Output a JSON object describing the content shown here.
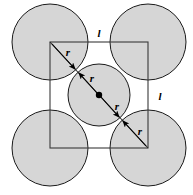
{
  "figure": {
    "background_color": "#ffffff",
    "circle_fill_color": "#d6d6d6",
    "stroke_color": "#1a1a1a",
    "square": {
      "x": 50,
      "y": 42,
      "side": 98,
      "side_label_top": "l",
      "side_label_right": "l"
    },
    "corner_circles": {
      "radius": 38,
      "centers": [
        {
          "cx": 50,
          "cy": 42,
          "name": "top-left"
        },
        {
          "cx": 148,
          "cy": 42,
          "name": "top-right"
        },
        {
          "cx": 50,
          "cy": 148,
          "name": "bottom-left"
        },
        {
          "cx": 148,
          "cy": 148,
          "name": "bottom-right"
        }
      ]
    },
    "center_circle": {
      "cx": 99,
      "cy": 95,
      "radius": 31,
      "center_dot_radius": 3.2
    },
    "diagonal": {
      "x1": 50,
      "y1": 42,
      "x2": 148,
      "y2": 148,
      "arrow_count": 4
    },
    "labels": {
      "r_top_left": {
        "text": "r",
        "x": 68,
        "y": 55
      },
      "r_center_upper": {
        "text": "r",
        "x": 89,
        "y": 81
      },
      "r_center_lower": {
        "text": "r",
        "x": 117,
        "y": 108
      },
      "r_bottom_right": {
        "text": "r",
        "x": 139,
        "y": 133
      },
      "l_top": {
        "text": "l",
        "x": 98,
        "y": 36
      },
      "l_right": {
        "text": "l",
        "x": 159,
        "y": 99
      }
    }
  }
}
